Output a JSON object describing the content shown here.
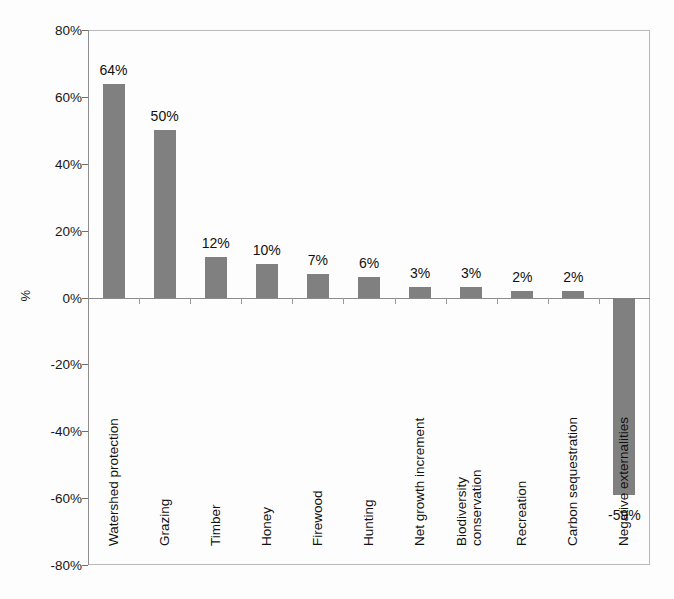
{
  "chart_data": {
    "type": "bar",
    "title": "",
    "subtitle": "",
    "xlabel": "",
    "ylabel": "%",
    "ylim": [
      -80,
      80
    ],
    "ytick_labels": [
      "80%",
      "60%",
      "40%",
      "20%",
      "0%",
      "-20%",
      "-40%",
      "-60%",
      "-80%"
    ],
    "ytick_values": [
      80,
      60,
      40,
      20,
      0,
      -20,
      -40,
      -60,
      -80
    ],
    "grid": false,
    "legend": null,
    "legend_position": "none",
    "bar_color": "#808080",
    "frame_color": "#b9b9b9",
    "axis_color": "#8b8b8b",
    "categories": [
      "Watershed protection",
      "Grazing",
      "Timber",
      "Honey",
      "Firewood",
      "Hunting",
      "Net growth increment",
      "Biodiversity conservation",
      "Recreation",
      "Carbon sequestration",
      "Negative externalities"
    ],
    "category_lines": [
      [
        "Watershed protection"
      ],
      [
        "Grazing"
      ],
      [
        "Timber"
      ],
      [
        "Honey"
      ],
      [
        "Firewood"
      ],
      [
        "Hunting"
      ],
      [
        "Net growth increment"
      ],
      [
        "Biodiversity",
        "conservation"
      ],
      [
        "Recreation"
      ],
      [
        "Carbon sequestration"
      ],
      [
        "Negative externalities"
      ]
    ],
    "values": [
      64,
      50,
      12,
      10,
      7,
      6,
      3,
      3,
      2,
      2,
      -59
    ],
    "value_labels": [
      "64%",
      "50%",
      "12%",
      "10%",
      "7%",
      "6%",
      "3%",
      "3%",
      "2%",
      "2%",
      "-59%"
    ]
  }
}
